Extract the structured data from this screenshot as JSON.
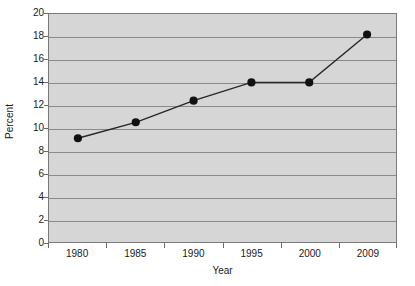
{
  "chart_data": {
    "type": "line",
    "title": "",
    "subtitle": "",
    "xlabel": "Year",
    "ylabel": "Percent",
    "categories": [
      "1980",
      "1985",
      "1990",
      "1995",
      "2000",
      "2009"
    ],
    "values": [
      9.1,
      10.5,
      12.4,
      14.0,
      14.0,
      18.2
    ],
    "series": [
      {
        "name": "Percent",
        "values": [
          9.1,
          10.5,
          12.4,
          14.0,
          14.0,
          18.2
        ]
      }
    ],
    "ylim": [
      0,
      20
    ],
    "ytick_step": 2,
    "yticks": [
      0,
      2,
      4,
      6,
      8,
      10,
      12,
      14,
      16,
      18,
      20
    ],
    "ytick_labels": [
      "0",
      "2",
      "4",
      "6",
      "8",
      "10",
      "12",
      "14",
      "16",
      "18",
      "20"
    ],
    "xtick_labels": [
      "1980",
      "1985",
      "1990",
      "1995",
      "2000",
      "2009"
    ],
    "grid": true,
    "grid_axis": "y",
    "legend": false,
    "legend_position": "none",
    "marker": "circle",
    "colors": {
      "plot_background": "#d6d6d6",
      "figure_background": "#ffffff",
      "gridline": "#8a8a8a",
      "axis_line": "#7a7a7a",
      "series_line": "#262626",
      "marker_fill": "#111111",
      "text": "#1a1a1a"
    }
  }
}
